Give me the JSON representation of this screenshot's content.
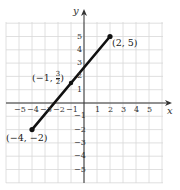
{
  "chart_data": {
    "type": "line",
    "title": "",
    "xlabel": "x",
    "ylabel": "y",
    "xlim": [
      -6,
      6
    ],
    "ylim": [
      -6,
      6
    ],
    "grid": true,
    "x_ticks": [
      "-5",
      "-4",
      "-3",
      "-2",
      "-1",
      "1",
      "2",
      "3",
      "4",
      "5"
    ],
    "y_ticks": [
      "5",
      "4",
      "3",
      "2",
      "1",
      "-1",
      "-2",
      "-3",
      "-4",
      "-5"
    ],
    "series": [
      {
        "name": "segment",
        "points": [
          [
            -4,
            -2
          ],
          [
            2,
            5
          ]
        ]
      }
    ],
    "points": [
      {
        "x": -4,
        "y": -2,
        "label": "(−4, −2)"
      },
      {
        "x": 2,
        "y": 5,
        "label": "(2, 5)"
      },
      {
        "x": -1,
        "y": 1.5,
        "label_prefix": "(−1, ",
        "label_num": "3",
        "label_den": "2",
        "label_suffix": ")"
      }
    ]
  },
  "colors": {
    "grid": "#d8d8d8",
    "axis": "#333333",
    "line": "#111111"
  }
}
